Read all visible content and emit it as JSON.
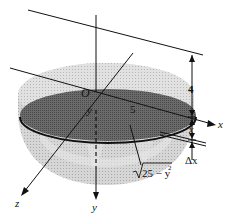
{
  "figure": {
    "labels": {
      "origin": "O",
      "radius": "5",
      "y_axis_upper": "y",
      "y_axis": "y",
      "x_axis": "x",
      "z_axis": "z",
      "height": "4",
      "depth": "x",
      "thickness": "Δx",
      "slice_radius": "√25 − y²",
      "slice_radius_radicand": "25 − y",
      "slice_radius_exp": "2"
    },
    "colors": {
      "bowl_light": "#d6d6d6",
      "bowl_mid": "#bdbdbd",
      "slice_dark": "#6e6e6e",
      "line": "#111111",
      "background": "#ffffff"
    }
  }
}
